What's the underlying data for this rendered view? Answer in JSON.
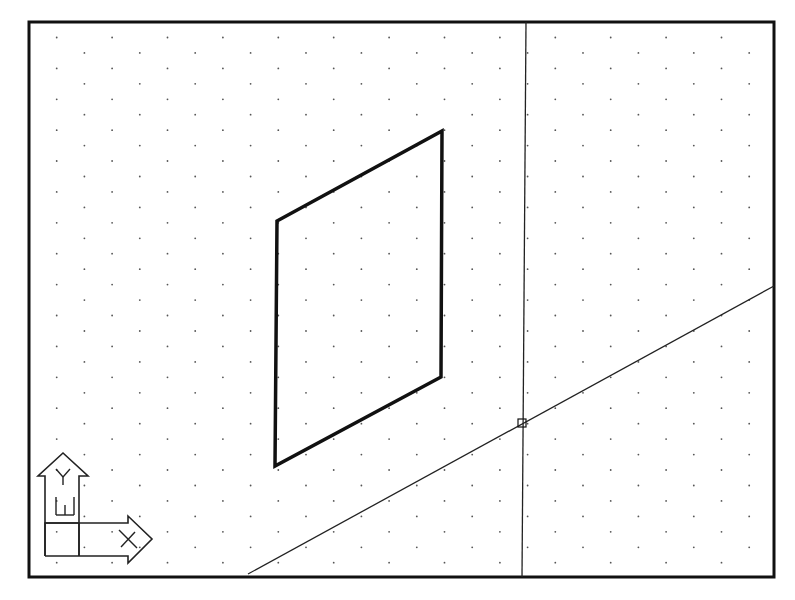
{
  "viewport": {
    "width": 795,
    "height": 600,
    "background": "#ffffff"
  },
  "colors": {
    "border": "#111111",
    "geometry": "#111111",
    "grid_dot": "#555555",
    "construction_line": "#222222",
    "ucs_icon": "#222222"
  },
  "drawing_area": {
    "left": 29,
    "top": 22,
    "right": 774,
    "bottom": 577,
    "border_width": 3
  },
  "grid": {
    "style": "isometric",
    "origin_x": 29,
    "origin_y": 22,
    "spacing_x": 55.4,
    "row_spacing_y": 15.45,
    "alternate_row_offset_x": 27.7,
    "dot_radius": 0.9
  },
  "entities": {
    "parallelogram": {
      "label": "Isometric plane face",
      "points": [
        [
          277,
          221
        ],
        [
          442,
          131
        ],
        [
          441,
          377
        ],
        [
          275,
          466
        ]
      ],
      "stroke_width": 3.5
    },
    "vertical_line": {
      "label": "Vertical construction line",
      "x1": 526,
      "y1": 22,
      "x2": 522,
      "y2": 577,
      "stroke_width": 1.3
    },
    "diagonal_line": {
      "label": "Isometric construction line",
      "x1": 248,
      "y1": 574,
      "x2": 774,
      "y2": 286,
      "stroke_width": 1.3
    },
    "intersection_marker": {
      "label": "Intersection snap marker",
      "cx": 522,
      "cy": 423,
      "size": 8
    }
  },
  "ucs_icon": {
    "label": "UCS icon",
    "y_axis_label": "Y",
    "x_axis_label": "X",
    "world_label": "W",
    "y_arrow": {
      "shaft_left": 45,
      "shaft_right": 79,
      "head_base_y": 476,
      "head_left": 38,
      "head_right": 88,
      "tip_x": 63,
      "tip_y": 453
    },
    "x_arrow": {
      "shaft_top": 523,
      "shaft_bottom": 556,
      "head_base_x": 128,
      "head_top": 516,
      "head_bottom": 563,
      "tip_x": 152,
      "tip_y": 539
    },
    "box": {
      "left": 45,
      "top": 523,
      "right": 79,
      "bottom": 556
    }
  }
}
